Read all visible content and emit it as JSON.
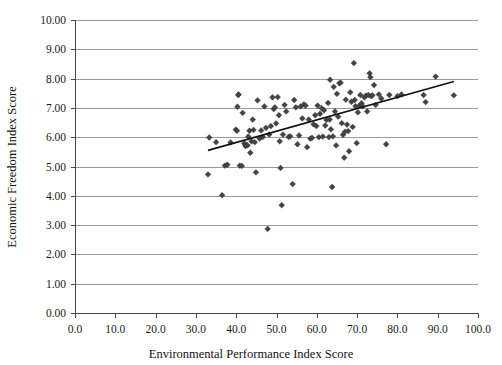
{
  "chart_data": {
    "type": "scatter",
    "title": "",
    "xlabel": "Environmental Performance Index Score",
    "ylabel": "Economic Freedom Index Score",
    "xlim": [
      0.0,
      100.0
    ],
    "ylim": [
      0.0,
      10.0
    ],
    "xticks": [
      0.0,
      10.0,
      20.0,
      30.0,
      40.0,
      50.0,
      60.0,
      70.0,
      80.0,
      90.0,
      100.0
    ],
    "xtick_labels": [
      "0.0",
      "10.0",
      "20.0",
      "30.0",
      "40.0",
      "50.0",
      "60.0",
      "70.0",
      "80.0",
      "90.0",
      "100.0"
    ],
    "yticks": [
      0.0,
      1.0,
      2.0,
      3.0,
      4.0,
      5.0,
      6.0,
      7.0,
      8.0,
      9.0,
      10.0
    ],
    "ytick_labels": [
      "0.00",
      "1.00",
      "2.00",
      "3.00",
      "4.00",
      "5.00",
      "6.00",
      "7.00",
      "8.00",
      "9.00",
      "10.00"
    ],
    "grid": "horizontal",
    "legend": "none",
    "marker_shape": "diamond",
    "marker_color": "#444444",
    "gridline_color": "#9a9a9a",
    "axis_color": "#4a4a4a",
    "trendline": {
      "type": "linear-fit",
      "color": "#111111",
      "x_start": 33.0,
      "y_start": 5.55,
      "x_end": 94.0,
      "y_end": 7.9
    },
    "points": [
      [
        33.3,
        5.99
      ],
      [
        33.0,
        4.73
      ],
      [
        35.0,
        5.83
      ],
      [
        36.5,
        4.02
      ],
      [
        37.2,
        5.03
      ],
      [
        37.8,
        5.06
      ],
      [
        38.6,
        5.82
      ],
      [
        39.9,
        6.26
      ],
      [
        40.2,
        6.22
      ],
      [
        40.3,
        7.04
      ],
      [
        40.5,
        7.44
      ],
      [
        40.6,
        7.46
      ],
      [
        40.9,
        5.03
      ],
      [
        41.4,
        5.02
      ],
      [
        41.6,
        6.83
      ],
      [
        42.0,
        5.79
      ],
      [
        42.3,
        5.7
      ],
      [
        42.5,
        5.74
      ],
      [
        42.8,
        5.72
      ],
      [
        43.0,
        6.02
      ],
      [
        43.3,
        6.22
      ],
      [
        43.5,
        5.47
      ],
      [
        43.8,
        5.86
      ],
      [
        44.1,
        6.6
      ],
      [
        44.3,
        6.25
      ],
      [
        44.6,
        5.83
      ],
      [
        44.9,
        4.8
      ],
      [
        45.3,
        7.26
      ],
      [
        45.8,
        5.95
      ],
      [
        46.2,
        6.23
      ],
      [
        46.6,
        6.01
      ],
      [
        47.0,
        7.05
      ],
      [
        47.4,
        6.32
      ],
      [
        47.8,
        2.87
      ],
      [
        48.2,
        6.09
      ],
      [
        48.6,
        6.38
      ],
      [
        49.0,
        7.36
      ],
      [
        49.3,
        6.96
      ],
      [
        49.6,
        7.02
      ],
      [
        49.9,
        6.47
      ],
      [
        50.3,
        7.37
      ],
      [
        50.6,
        6.75
      ],
      [
        50.8,
        5.86
      ],
      [
        51.0,
        4.95
      ],
      [
        51.3,
        3.68
      ],
      [
        51.6,
        6.09
      ],
      [
        52.0,
        7.1
      ],
      [
        52.4,
        6.88
      ],
      [
        53.0,
        6.01
      ],
      [
        53.4,
        6.03
      ],
      [
        54.0,
        4.4
      ],
      [
        54.4,
        7.27
      ],
      [
        54.8,
        7.02
      ],
      [
        55.2,
        5.76
      ],
      [
        55.6,
        6.06
      ],
      [
        56.0,
        7.05
      ],
      [
        56.4,
        6.64
      ],
      [
        56.8,
        7.12
      ],
      [
        57.2,
        7.08
      ],
      [
        57.6,
        5.66
      ],
      [
        58.0,
        6.6
      ],
      [
        58.4,
        5.95
      ],
      [
        58.8,
        5.98
      ],
      [
        59.2,
        6.44
      ],
      [
        59.6,
        6.75
      ],
      [
        59.9,
        6.38
      ],
      [
        60.2,
        7.08
      ],
      [
        60.5,
        6.0
      ],
      [
        60.8,
        6.8
      ],
      [
        61.2,
        6.99
      ],
      [
        61.5,
        6.02
      ],
      [
        61.8,
        6.92
      ],
      [
        62.1,
        6.4
      ],
      [
        62.4,
        6.59
      ],
      [
        62.8,
        7.17
      ],
      [
        63.0,
        6.0
      ],
      [
        63.2,
        6.6
      ],
      [
        63.3,
        7.96
      ],
      [
        63.5,
        6.27
      ],
      [
        63.8,
        4.3
      ],
      [
        64.0,
        6.03
      ],
      [
        64.2,
        7.72
      ],
      [
        64.5,
        6.88
      ],
      [
        64.8,
        5.72
      ],
      [
        65.0,
        7.48
      ],
      [
        65.3,
        6.7
      ],
      [
        65.6,
        7.84
      ],
      [
        65.9,
        7.86
      ],
      [
        66.2,
        6.48
      ],
      [
        66.5,
        6.08
      ],
      [
        66.8,
        5.3
      ],
      [
        67.0,
        6.19
      ],
      [
        67.2,
        7.28
      ],
      [
        67.5,
        6.43
      ],
      [
        67.8,
        6.21
      ],
      [
        68.0,
        5.52
      ],
      [
        68.3,
        7.53
      ],
      [
        68.6,
        7.21
      ],
      [
        68.9,
        6.35
      ],
      [
        69.2,
        8.53
      ],
      [
        69.4,
        7.27
      ],
      [
        69.6,
        7.06
      ],
      [
        69.9,
        5.8
      ],
      [
        70.2,
        6.85
      ],
      [
        70.5,
        7.07
      ],
      [
        70.8,
        7.44
      ],
      [
        71.1,
        7.16
      ],
      [
        71.4,
        7.06
      ],
      [
        71.8,
        7.36
      ],
      [
        72.2,
        7.42
      ],
      [
        72.5,
        6.88
      ],
      [
        72.8,
        7.44
      ],
      [
        73.1,
        8.18
      ],
      [
        73.3,
        8.05
      ],
      [
        73.5,
        7.4
      ],
      [
        73.8,
        7.43
      ],
      [
        74.2,
        7.78
      ],
      [
        74.6,
        7.1
      ],
      [
        75.4,
        7.46
      ],
      [
        76.0,
        7.32
      ],
      [
        77.2,
        5.76
      ],
      [
        78.0,
        7.44
      ],
      [
        80.0,
        7.4
      ],
      [
        81.0,
        7.46
      ],
      [
        86.5,
        7.44
      ],
      [
        87.0,
        7.2
      ],
      [
        89.5,
        8.07
      ],
      [
        94.0,
        7.43
      ]
    ]
  }
}
